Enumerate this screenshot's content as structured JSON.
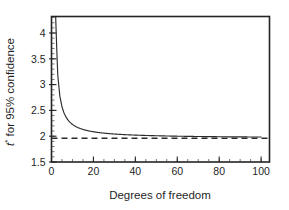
{
  "chart_data": {
    "type": "line",
    "title": "",
    "xlabel": "Degrees of freedom",
    "ylabel": "t* for 95% confidence",
    "ylabel_parts": {
      "symbol": "t",
      "superscript": "*",
      "rest": " for 95% confidence"
    },
    "xlim": [
      0,
      104
    ],
    "ylim": [
      1.5,
      4.32
    ],
    "grid": false,
    "legend": null,
    "xticks": [
      0,
      20,
      40,
      60,
      80,
      100
    ],
    "xticklabels": [
      "0",
      "20",
      "40",
      "60",
      "80",
      "100"
    ],
    "xminor_step": 5,
    "yticks": [
      1.5,
      2,
      2.5,
      3,
      3.5,
      4
    ],
    "yticklabels": [
      "1.5",
      "2",
      "2.5",
      "3",
      "3.5",
      "4"
    ],
    "yminor_step": 0.1,
    "series": [
      {
        "name": "t* critical value (95% confidence)",
        "style": "solid",
        "x": [
          1,
          2,
          3,
          4,
          5,
          6,
          7,
          8,
          9,
          10,
          11,
          12,
          13,
          14,
          15,
          16,
          17,
          18,
          19,
          20,
          22,
          24,
          26,
          28,
          30,
          35,
          40,
          45,
          50,
          55,
          60,
          65,
          70,
          75,
          80,
          85,
          90,
          95,
          100
        ],
        "values": [
          12.706,
          4.303,
          3.182,
          2.776,
          2.571,
          2.447,
          2.365,
          2.306,
          2.262,
          2.228,
          2.201,
          2.179,
          2.16,
          2.145,
          2.131,
          2.12,
          2.11,
          2.101,
          2.093,
          2.086,
          2.074,
          2.064,
          2.056,
          2.048,
          2.042,
          2.03,
          2.021,
          2.014,
          2.009,
          2.004,
          2.0,
          1.997,
          1.994,
          1.992,
          1.99,
          1.988,
          1.987,
          1.985,
          1.984
        ]
      },
      {
        "name": "z* normal asymptote",
        "style": "dashed",
        "constant_y": 1.96,
        "x": [
          0,
          104
        ],
        "values": [
          1.96,
          1.96
        ]
      }
    ],
    "annotations": []
  },
  "figure": {
    "background_color": "#ffffff",
    "line_color": "#2b2b2b",
    "axis_color": "#232323",
    "text_color": "#1f1f1f"
  }
}
